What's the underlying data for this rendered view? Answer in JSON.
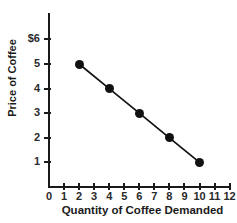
{
  "page": {
    "clipped_top_text": "xxx xx"
  },
  "chart_data": {
    "type": "line",
    "title": "",
    "xlabel": "Quantity of Coffee Demanded",
    "ylabel": "Price of Coffee",
    "xlim": [
      0,
      12
    ],
    "ylim": [
      0,
      6
    ],
    "grid": false,
    "legend": false,
    "x_ticks": [
      "0",
      "1",
      "2",
      "3",
      "4",
      "5",
      "6",
      "7",
      "8",
      "9",
      "10",
      "11",
      "12"
    ],
    "x_tick_values": [
      0,
      1,
      2,
      3,
      4,
      5,
      6,
      7,
      8,
      9,
      10,
      11,
      12
    ],
    "y_ticks": [
      "1",
      "2",
      "3",
      "4",
      "5",
      "$6"
    ],
    "y_tick_values": [
      1,
      2,
      3,
      4,
      5,
      6
    ],
    "series": [
      {
        "name": "Demand",
        "marker": "filled-circle",
        "color": "#111111",
        "x": [
          2,
          4,
          6,
          8,
          10
        ],
        "y": [
          5,
          4,
          3,
          2,
          1
        ],
        "points": [
          {
            "x": 2,
            "y": 5
          },
          {
            "x": 4,
            "y": 4
          },
          {
            "x": 6,
            "y": 3
          },
          {
            "x": 8,
            "y": 2
          },
          {
            "x": 10,
            "y": 1
          }
        ]
      }
    ]
  }
}
